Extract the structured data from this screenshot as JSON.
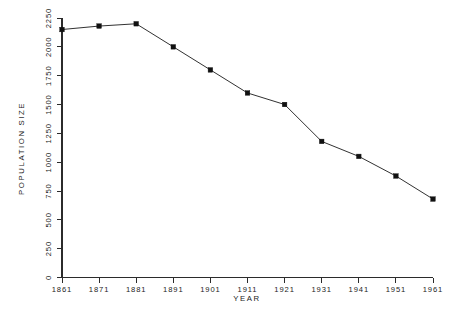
{
  "chart_data": {
    "type": "line",
    "title": "",
    "subtitle": "",
    "xlabel": "YEAR",
    "ylabel": "POPULATION SIZE",
    "x": [
      1861,
      1871,
      1881,
      1891,
      1901,
      1911,
      1921,
      1931,
      1941,
      1951,
      1961
    ],
    "categories": [
      "1861",
      "1871",
      "1881",
      "1891",
      "1901",
      "1911",
      "1921",
      "1931",
      "1941",
      "1951",
      "1961"
    ],
    "values": [
      2150,
      2180,
      2200,
      2000,
      1800,
      1600,
      1500,
      1180,
      1050,
      880,
      680
    ],
    "series": [
      {
        "name": "Population Size",
        "values": [
          2150,
          2180,
          2200,
          2000,
          1800,
          1600,
          1500,
          1180,
          1050,
          880,
          680
        ]
      }
    ],
    "xlim": [
      1861,
      1961
    ],
    "ylim": [
      0,
      2250
    ],
    "yticks": [
      0,
      250,
      500,
      750,
      1000,
      1250,
      1500,
      1750,
      2000,
      2250
    ],
    "ytick_labels": [
      "0",
      "250",
      "500",
      "750",
      "1000",
      "1250",
      "1500",
      "1750",
      "2000",
      "2250"
    ],
    "xticks": [
      1861,
      1871,
      1881,
      1891,
      1901,
      1911,
      1921,
      1931,
      1941,
      1951,
      1961
    ],
    "xtick_labels": [
      "1861",
      "1871",
      "1881",
      "1891",
      "1901",
      "1911",
      "1921",
      "1931",
      "1941",
      "1951",
      "1961"
    ],
    "grid": false,
    "legend": false,
    "legend_position": "none",
    "marker": "filled-square",
    "line_color": "#1a1a1a",
    "marker_color": "#111111",
    "axis_color": "#2b2b2b",
    "background_color": "#ffffff",
    "ytick_label_rotation": 90,
    "ylabel_rotation": 90
  }
}
